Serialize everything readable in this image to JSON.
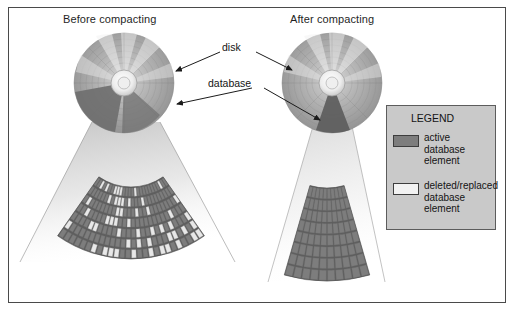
{
  "figure": {
    "background_color": "#ffffff",
    "frame_color": "#4a4a4a",
    "panels": {
      "before": {
        "title": "Before compacting"
      },
      "after": {
        "title": "After compacting"
      }
    },
    "annotations": {
      "disk": "disk",
      "database": "database"
    },
    "legend": {
      "title": "LEGEND",
      "items": [
        {
          "swatch": "active",
          "swatch_color": "#7d7d7d",
          "lines": [
            "active",
            "database",
            "element"
          ]
        },
        {
          "swatch": "deleted",
          "swatch_color": "#f2f2f2",
          "lines": [
            "deleted/replaced",
            "database",
            "element"
          ]
        }
      ]
    },
    "diagram_data": {
      "type": "diagram",
      "subject": "Database compacting on disk",
      "disks": [
        {
          "panel": "before",
          "center": [
            124,
            83
          ],
          "radius": 50,
          "database_wedge_start_deg": 100,
          "database_wedge_end_deg": 170,
          "database_wedge_fill": "#6f6f6f",
          "platter_fill": "#9a9a9a",
          "hub_fill": "#f0f0f0"
        },
        {
          "panel": "after",
          "center": [
            332,
            83
          ],
          "radius": 50,
          "database_wedge_start_deg": 72,
          "database_wedge_end_deg": 108,
          "database_wedge_fill": "#5f5f5f",
          "platter_fill": "#9a9a9a",
          "hub_fill": "#f0f0f0"
        }
      ],
      "fans": [
        {
          "panel": "before",
          "label": "fragmented database extent",
          "rings": 7,
          "sectors": 26,
          "active_color": "#7d7d7d",
          "deleted_color": "#e8e8e8",
          "deleted_fraction": 0.3
        },
        {
          "panel": "after",
          "label": "compacted database extent",
          "rings": 8,
          "sectors": 10,
          "active_color": "#7d7d7d",
          "deleted_color": "#e8e8e8",
          "deleted_fraction": 0.0
        }
      ]
    }
  }
}
